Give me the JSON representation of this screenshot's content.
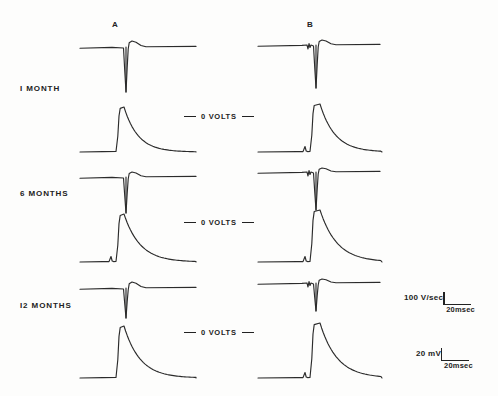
{
  "figure": {
    "columns": [
      {
        "label": "A",
        "x": 115
      },
      {
        "label": "B",
        "x": 310
      }
    ],
    "rows": [
      {
        "label": "I  MONTH",
        "y": 88
      },
      {
        "label": "6  MONTHS",
        "y": 193
      },
      {
        "label": "I2  MONTHS",
        "y": 305
      }
    ],
    "zero_volts_label": "0  VOLTS",
    "zero_volts_markers": [
      {
        "y": 118
      },
      {
        "y": 224
      },
      {
        "y": 334
      }
    ],
    "calibrations": [
      {
        "value": "100  V/sec",
        "time": "20msec",
        "x": 404,
        "y": 292
      },
      {
        "value": "20  mV",
        "time": "20msec",
        "x": 416,
        "y": 348
      }
    ],
    "trace_color": "#2b2b2b"
  },
  "chart_data": {
    "type": "line",
    "title": "",
    "xlabel": "",
    "ylabel": "",
    "axis_calibration": {
      "derivative_amplitude": "100 V/sec",
      "potential_amplitude": "20 mV",
      "time_base": "20msec"
    },
    "panels": [
      {
        "row": "I  MONTH",
        "column": "A",
        "trace": "derivative",
        "baseline_y": 47,
        "x0": 80,
        "x1": 196,
        "features": {
          "upstroke_peak_offset": -6,
          "downstroke_depth": 45,
          "spike_x": 126,
          "artifact": false
        }
      },
      {
        "row": "I  MONTH",
        "column": "A",
        "trace": "action-potential",
        "baseline_y": 152,
        "x0": 80,
        "x1": 196,
        "features": {
          "peak_height": 45,
          "rise_x": 117,
          "peak_x": 124,
          "decay_tau": 14,
          "artifact": false
        }
      },
      {
        "row": "I  MONTH",
        "column": "B",
        "trace": "derivative",
        "baseline_y": 45,
        "x0": 258,
        "x1": 380,
        "features": {
          "upstroke_peak_offset": -5,
          "downstroke_depth": 43,
          "spike_x": 316,
          "artifact": true
        }
      },
      {
        "row": "I  MONTH",
        "column": "B",
        "trace": "action-potential",
        "baseline_y": 152,
        "x0": 258,
        "x1": 382,
        "features": {
          "peak_height": 48,
          "rise_x": 311,
          "peak_x": 320,
          "decay_tau": 15,
          "artifact": true
        }
      },
      {
        "row": "6  MONTHS",
        "column": "A",
        "trace": "derivative",
        "baseline_y": 177,
        "x0": 80,
        "x1": 196,
        "features": {
          "upstroke_peak_offset": -5,
          "downstroke_depth": 36,
          "spike_x": 126,
          "artifact": false
        }
      },
      {
        "row": "6  MONTHS",
        "column": "A",
        "trace": "action-potential",
        "baseline_y": 262,
        "x0": 80,
        "x1": 196,
        "features": {
          "peak_height": 48,
          "rise_x": 117,
          "peak_x": 124,
          "decay_tau": 16,
          "artifact": true
        }
      },
      {
        "row": "6  MONTHS",
        "column": "B",
        "trace": "derivative",
        "baseline_y": 172,
        "x0": 258,
        "x1": 380,
        "features": {
          "upstroke_peak_offset": -4,
          "downstroke_depth": 38,
          "spike_x": 316,
          "artifact": true
        }
      },
      {
        "row": "6  MONTHS",
        "column": "B",
        "trace": "action-potential",
        "baseline_y": 262,
        "x0": 258,
        "x1": 382,
        "features": {
          "peak_height": 52,
          "rise_x": 311,
          "peak_x": 320,
          "decay_tau": 17,
          "artifact": true
        }
      },
      {
        "row": "I2  MONTHS",
        "column": "A",
        "trace": "derivative",
        "baseline_y": 288,
        "x0": 80,
        "x1": 196,
        "features": {
          "upstroke_peak_offset": -6,
          "downstroke_depth": 30,
          "spike_x": 126,
          "artifact": false
        }
      },
      {
        "row": "I2  MONTHS",
        "column": "A",
        "trace": "action-potential",
        "baseline_y": 378,
        "x0": 80,
        "x1": 196,
        "features": {
          "peak_height": 52,
          "rise_x": 117,
          "peak_x": 124,
          "decay_tau": 16,
          "artifact": false
        }
      },
      {
        "row": "I2  MONTHS",
        "column": "B",
        "trace": "derivative",
        "baseline_y": 283,
        "x0": 258,
        "x1": 380,
        "features": {
          "upstroke_peak_offset": -4,
          "downstroke_depth": 28,
          "spike_x": 316,
          "artifact": true
        }
      },
      {
        "row": "I2  MONTHS",
        "column": "B",
        "trace": "action-potential",
        "baseline_y": 378,
        "x0": 258,
        "x1": 382,
        "features": {
          "peak_height": 55,
          "rise_x": 311,
          "peak_x": 320,
          "decay_tau": 17,
          "artifact": true
        }
      }
    ]
  }
}
